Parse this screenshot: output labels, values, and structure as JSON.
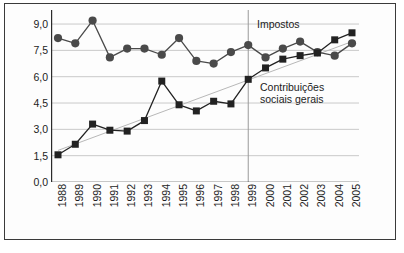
{
  "chart_data": {
    "type": "line",
    "title": "",
    "subtitle": "",
    "xlabel": "",
    "ylabel": "",
    "grid": true,
    "legend_position": "inline-annotations",
    "categories": [
      "1988",
      "1989",
      "1990",
      "1991",
      "1992",
      "1993",
      "1994",
      "1995",
      "1996",
      "1997",
      "1998",
      "1999",
      "2000",
      "2001",
      "2002",
      "2003",
      "2004",
      "2005"
    ],
    "x": [
      1988,
      1989,
      1990,
      1991,
      1992,
      1993,
      1994,
      1995,
      1996,
      1997,
      1998,
      1999,
      2000,
      2001,
      2002,
      2003,
      2004,
      2005
    ],
    "ylim": [
      0,
      9.8
    ],
    "ytick_values": [
      0.0,
      1.5,
      3.0,
      4.5,
      6.0,
      7.5,
      9.0
    ],
    "ytick_labels": [
      "0,0",
      "1,5",
      "3,0",
      "4,5",
      "6,0",
      "7,5",
      "9,0"
    ],
    "series": [
      {
        "name": "Impostos",
        "marker": "circle",
        "color": "#4a4a4a",
        "values": [
          8.2,
          7.9,
          9.2,
          7.1,
          7.6,
          7.6,
          7.25,
          8.2,
          6.9,
          6.75,
          7.4,
          7.8,
          7.1,
          7.6,
          8.0,
          7.4,
          7.2,
          7.9
        ]
      },
      {
        "name": "Contribuições sociais gerais",
        "marker": "square",
        "color": "#222222",
        "values": [
          1.55,
          2.15,
          3.3,
          2.95,
          2.9,
          3.5,
          5.75,
          4.4,
          4.05,
          4.6,
          4.45,
          5.85,
          6.5,
          7.0,
          7.2,
          7.35,
          8.1,
          8.5
        ]
      }
    ],
    "trendlines": [
      {
        "for_series": "Contribuições sociais gerais",
        "color": "#b8b8b8",
        "x_start": 1988,
        "y_start": 1.8,
        "x_end": 2005,
        "y_end": 8.0
      }
    ],
    "reference_lines": [
      {
        "orientation": "vertical",
        "x": 1999,
        "color": "#9a9a9a"
      }
    ],
    "annotations": [
      {
        "text": "Impostos",
        "x": 2001.2,
        "y": 8.55
      },
      {
        "text": "Contribuições",
        "x": 2001.4,
        "y": 5.45
      },
      {
        "text": "sociais gerais",
        "x": 2001.4,
        "y": 4.95
      }
    ],
    "colors": {
      "impostos": "#4a4a4a",
      "contribuicoes": "#222222",
      "gridline": "#c9c9c9",
      "axis": "#2b2b2b",
      "trendline": "#b8b8b8",
      "reference_line": "#9a9a9a",
      "frame": "#3a3a3a",
      "background": "#fdfdfd",
      "text": "#1c1c1c"
    },
    "labels": {
      "impostos": "Impostos",
      "contribuicoes_line1": "Contribuições",
      "contribuicoes_line2": "sociais gerais"
    }
  }
}
